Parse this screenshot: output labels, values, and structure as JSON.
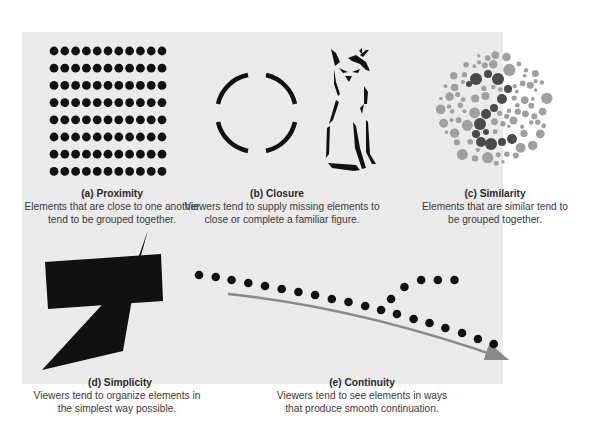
{
  "figure": {
    "background_color": "#ebebeb",
    "panels": [
      {
        "id": "a",
        "title": "(a) Proximity",
        "description_line1": "Elements that are close to one another",
        "description_line2": "tend to be grouped together.",
        "graphic": "dot-grid",
        "grid": {
          "rows": 8,
          "cols": 11,
          "dot_color": "#111111"
        }
      },
      {
        "id": "b",
        "title": "(b) Closure",
        "description_line1": "Viewers tend to supply missing elements to",
        "description_line2": "close or complete a familiar figure.",
        "graphic": "broken-circle-and-wolf-outline"
      },
      {
        "id": "c",
        "title": "(c) Similarity",
        "description_line1": "Elements that are similar tend to",
        "description_line2": "be grouped together.",
        "graphic": "color-blindness-plate",
        "colors": {
          "light": "#a0a0a0",
          "dark": "#4a4a4a"
        }
      },
      {
        "id": "d",
        "title": "(d) Simplicity",
        "description_line1": "Viewers tend to organize elements in",
        "description_line2": "the simplest way possible.",
        "graphic": "rectangle-and-triangle-overlap"
      },
      {
        "id": "e",
        "title": "(e) Continuity",
        "description_line1": "Viewers tend to see elements in ways",
        "description_line2": "that produce smooth continuation.",
        "graphic": "dot-line-with-branch-and-arrow",
        "arrow_color": "#8a8a8a"
      }
    ]
  }
}
